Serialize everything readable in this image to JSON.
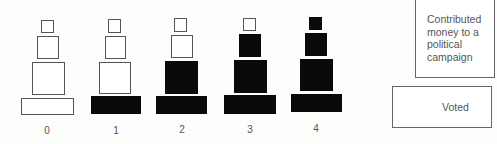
{
  "figure": {
    "type": "cumulative-scale-pyramids",
    "columns": [
      {
        "label": "0",
        "filled": [
          false,
          false,
          false,
          false
        ]
      },
      {
        "label": "1",
        "filled": [
          true,
          false,
          false,
          false
        ]
      },
      {
        "label": "2",
        "filled": [
          true,
          true,
          false,
          false
        ]
      },
      {
        "label": "3",
        "filled": [
          true,
          true,
          true,
          false
        ]
      },
      {
        "label": "4",
        "filled": [
          true,
          true,
          true,
          true
        ]
      }
    ],
    "levels_bottom_to_top": [
      "base",
      "level-2",
      "level-3",
      "top"
    ],
    "colors": {
      "filled": "#0a0a0a",
      "empty": "#ffffff",
      "outline": "#555555"
    }
  },
  "legend": {
    "contributed": "Contributed money to a political campaign",
    "contributed_lines": [
      "Contributed",
      "money to a",
      "political",
      "campaign"
    ],
    "voted": "Voted"
  }
}
